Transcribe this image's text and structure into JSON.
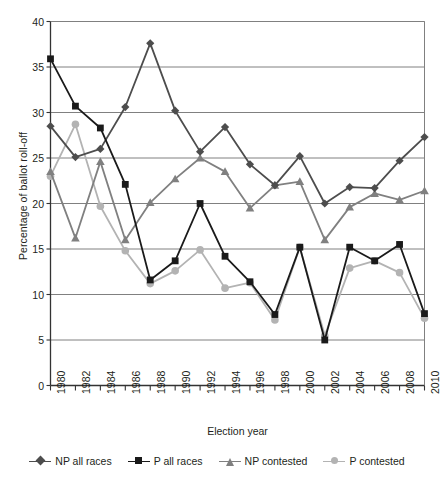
{
  "chart_data": {
    "type": "line",
    "title": "",
    "xlabel": "Election year",
    "ylabel": "Percentage of ballot roll-off",
    "categories": [
      "1980",
      "1982",
      "1984",
      "1986",
      "1988",
      "1990",
      "1992",
      "1994",
      "1996",
      "1998",
      "2000",
      "2002",
      "2004",
      "2006",
      "2008",
      "2010"
    ],
    "x": [
      1980,
      1982,
      1984,
      1986,
      1988,
      1990,
      1992,
      1994,
      1996,
      1998,
      2000,
      2002,
      2004,
      2006,
      2008,
      2010
    ],
    "ylim": [
      0,
      40
    ],
    "yticks": [
      0,
      5,
      10,
      15,
      20,
      25,
      30,
      35,
      40
    ],
    "grid": "horizontal",
    "legend_position": "bottom",
    "series": [
      {
        "name": "NP all races",
        "color": "#4d4d4d",
        "marker": "diamond",
        "values": [
          28.5,
          25.1,
          26.0,
          30.6,
          37.6,
          30.2,
          25.7,
          28.4,
          24.3,
          22.0,
          25.2,
          20.0,
          21.8,
          21.7,
          24.7,
          27.3
        ]
      },
      {
        "name": "P all races",
        "color": "#1a1a1a",
        "marker": "square",
        "values": [
          35.9,
          30.7,
          28.3,
          22.1,
          11.6,
          13.7,
          20.0,
          14.2,
          11.4,
          7.8,
          15.2,
          5.0,
          15.2,
          13.7,
          15.5,
          7.9
        ]
      },
      {
        "name": "NP contested",
        "color": "#808080",
        "marker": "triangle",
        "values": [
          23.5,
          16.2,
          24.6,
          16.0,
          20.1,
          22.7,
          25.0,
          23.5,
          19.5,
          22.0,
          22.4,
          16.0,
          19.6,
          21.1,
          20.4,
          21.4
        ]
      },
      {
        "name": "P contested",
        "color": "#b3b3b3",
        "marker": "circle",
        "values": [
          23.0,
          28.7,
          19.7,
          14.8,
          11.2,
          12.6,
          14.9,
          10.7,
          11.3,
          7.2,
          15.2,
          5.5,
          12.9,
          13.7,
          12.4,
          7.4
        ]
      }
    ]
  },
  "axes": {
    "y_title": "Percentage of ballot roll-off",
    "x_title": "Election year",
    "y_tick_labels": [
      "0",
      "5",
      "10",
      "15",
      "20",
      "25",
      "30",
      "35",
      "40"
    ],
    "x_tick_labels": [
      "1980",
      "1982",
      "1984",
      "1986",
      "1988",
      "1990",
      "1992",
      "1994",
      "1996",
      "1998",
      "2000",
      "2002",
      "2004",
      "2006",
      "2008",
      "2010"
    ]
  },
  "legend": {
    "items": [
      {
        "label": "NP all races"
      },
      {
        "label": "P all races"
      },
      {
        "label": "NP contested"
      },
      {
        "label": "P contested"
      }
    ]
  },
  "colors": {
    "np_all_races": "#4d4d4d",
    "p_all_races": "#1a1a1a",
    "np_contested": "#808080",
    "p_contested": "#b3b3b3",
    "grid": "#808080",
    "axis": "#333333",
    "text": "#231f20"
  }
}
